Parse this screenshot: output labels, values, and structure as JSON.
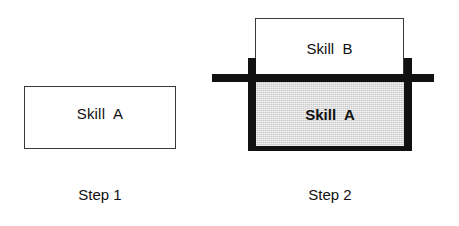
{
  "figure": {
    "background_color": "#ffffff",
    "width": 459,
    "height": 226,
    "line_color": "#3a3a3a",
    "bar_color": "#111111",
    "fill_gray": "#c9c9c9"
  },
  "steps": [
    {
      "caption": "Step 1",
      "boxes": [
        {
          "label": "Skill  A",
          "fill": "white",
          "border": "thin",
          "bold": false
        }
      ]
    },
    {
      "caption": "Step 2",
      "boxes": [
        {
          "label": "Skill  B",
          "fill": "white",
          "border": "thin",
          "bold": false
        },
        {
          "label": "Skill  A",
          "fill": "gray",
          "border": "thick",
          "bold": true
        }
      ]
    }
  ]
}
